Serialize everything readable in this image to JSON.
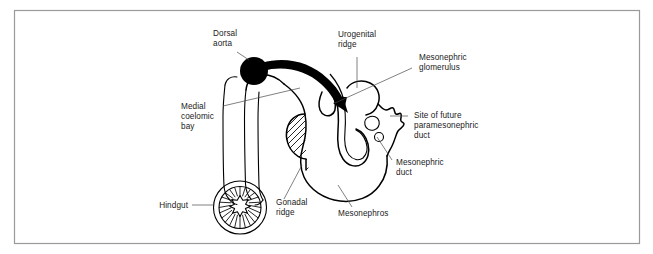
{
  "figure": {
    "frame_color": "#9a9a9a",
    "background_color": "#ffffff",
    "ink_color": "#000000",
    "leader_color": "#4a4a4a"
  },
  "labels": {
    "dorsal_aorta": {
      "lines": [
        "Dorsal",
        "aorta"
      ]
    },
    "urogenital_ridge": {
      "lines": [
        "Urogenital",
        "ridge"
      ]
    },
    "mesonephric_glomerulus": {
      "lines": [
        "Mesonephric",
        "glomerulus"
      ]
    },
    "site_of_future_paramesonephric_duct": {
      "lines": [
        "Site of future",
        "paramesonephric",
        "duct"
      ]
    },
    "mesonephric_duct": {
      "lines": [
        "Mesonephric",
        "duct"
      ]
    },
    "mesonephros": {
      "lines": [
        "Mesonephros"
      ]
    },
    "gonadal_ridge": {
      "lines": [
        "Gonadal",
        "ridge"
      ]
    },
    "hindgut": {
      "lines": [
        "Hindgut"
      ]
    },
    "medial_coelomic_bay": {
      "lines": [
        "Medial",
        "coelomic",
        "bay"
      ]
    }
  },
  "structures": {
    "dorsal_aorta_marker": "filled-black-circle",
    "migration_arrow": "thick-black-curved-arrow",
    "germ_cell_arrow": "thin-curved-arrow",
    "gonadal_ridge_fill": "diagonal-hatching",
    "hindgut_marker": "concentric-circles-with-radial-spokes"
  }
}
